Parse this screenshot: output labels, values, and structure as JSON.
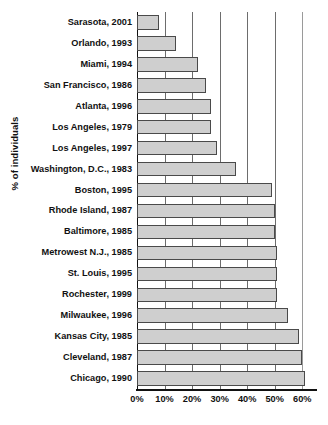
{
  "chart_data": {
    "type": "bar",
    "orientation": "horizontal",
    "title": "",
    "subtitle": "",
    "xlabel": "",
    "ylabel": "% of individuals",
    "xlim": [
      0,
      65
    ],
    "xticks": [
      0,
      10,
      20,
      30,
      40,
      50,
      60
    ],
    "xtick_labels": [
      "0%",
      "10%",
      "20%",
      "30%",
      "40%",
      "50%",
      "60%"
    ],
    "grid": "vertical",
    "legend": null,
    "categories": [
      "Sarasota, 2001",
      "Orlando, 1993",
      "Miami, 1994",
      "San Francisco, 1986",
      "Atlanta, 1996",
      "Los Angeles, 1979",
      "Los Angeles, 1997",
      "Washington, D.C., 1983",
      "Boston, 1995",
      "Rhode Island, 1987",
      "Baltimore, 1985",
      "Metrowest N.J., 1985",
      "St. Louis, 1995",
      "Rochester, 1999",
      "Milwaukee, 1996",
      "Kansas City, 1985",
      "Cleveland, 1987",
      "Chicago, 1990"
    ],
    "values": [
      8,
      14,
      22,
      25,
      27,
      27,
      29,
      36,
      49,
      50,
      50,
      51,
      51,
      51,
      55,
      59,
      60,
      61
    ],
    "bar_fill_color": "#cfcfcf",
    "bar_edge_color": "#4a4a4a",
    "gridline_color": "#6d6d6d",
    "axis_color": "#111111"
  }
}
